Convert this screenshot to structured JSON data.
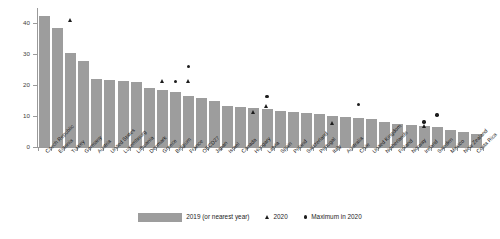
{
  "chart_data": {
    "type": "bar",
    "title": "",
    "subtitle": "",
    "xlabel": "",
    "ylabel": "",
    "ylim": [
      0,
      45
    ],
    "yticks": [
      0,
      10,
      20,
      30,
      40
    ],
    "grid": false,
    "legend_position": "bottom",
    "categories": [
      "Czech Republic",
      "Estonia",
      "Turkey",
      "Germany",
      "Austria",
      "United States",
      "Luxembourg",
      "Lithuania",
      "Denmark",
      "Greece",
      "Belgium",
      "France",
      "OECD27",
      "Japan",
      "Israel",
      "Canada",
      "Hungary",
      "Latvia",
      "Spain",
      "Poland",
      "Switzerland",
      "Portugal",
      "Italy",
      "Australia",
      "Chile",
      "United Kingdom",
      "Netherlands",
      "Finland",
      "Norway",
      "Ireland",
      "Sweden",
      "Mexico",
      "New Zealand",
      "Costa Rica"
    ],
    "series": [
      {
        "name": "2019 (or nearest year)",
        "type": "bar",
        "color": "#9d9d9d",
        "values": [
          42.5,
          38.4,
          30.3,
          27.8,
          21.9,
          21.6,
          21.4,
          21.1,
          19.2,
          18.4,
          17.9,
          16.5,
          15.8,
          14.9,
          13.2,
          12.9,
          12.6,
          12.3,
          11.8,
          11.4,
          10.9,
          10.6,
          10.2,
          9.8,
          9.4,
          9.1,
          8.2,
          7.4,
          7.1,
          6.8,
          6.4,
          5.6,
          4.8,
          4.2
        ]
      },
      {
        "name": "2020",
        "type": "scatter",
        "marker": "triangle",
        "color": "#1d1d1d",
        "points": [
          {
            "category": "Turkey",
            "value": 41.0
          },
          {
            "category": "Greece",
            "value": 21.3
          },
          {
            "category": "France",
            "value": 21.2
          },
          {
            "category": "Hungary",
            "value": 11.3
          },
          {
            "category": "Latvia",
            "value": 13.2
          },
          {
            "category": "Italy",
            "value": 7.8
          },
          {
            "category": "Ireland",
            "value": 6.9
          }
        ]
      },
      {
        "name": "Maximum in 2020",
        "type": "scatter",
        "marker": "circle",
        "color": "#1d1d1d",
        "points": [
          {
            "category": "Belgium",
            "value": 21.3
          },
          {
            "category": "France",
            "value": 26.0
          },
          {
            "category": "Latvia",
            "value": 16.3
          },
          {
            "category": "Chile",
            "value": 13.8
          },
          {
            "category": "Ireland",
            "value": 8.1
          },
          {
            "category": "Sweden",
            "value": 10.3
          }
        ]
      }
    ],
    "legend": [
      {
        "label": "2019 (or nearest year)",
        "marker": "swatch"
      },
      {
        "label": "2020",
        "marker": "triangle"
      },
      {
        "label": "Maximum in 2020",
        "marker": "circle"
      }
    ],
    "colors": {
      "bar": "#9d9d9d",
      "marker": "#1d1d1d",
      "axis": "#9a9a9a",
      "text": "#1d1d1d",
      "background": "#ffffff"
    }
  }
}
